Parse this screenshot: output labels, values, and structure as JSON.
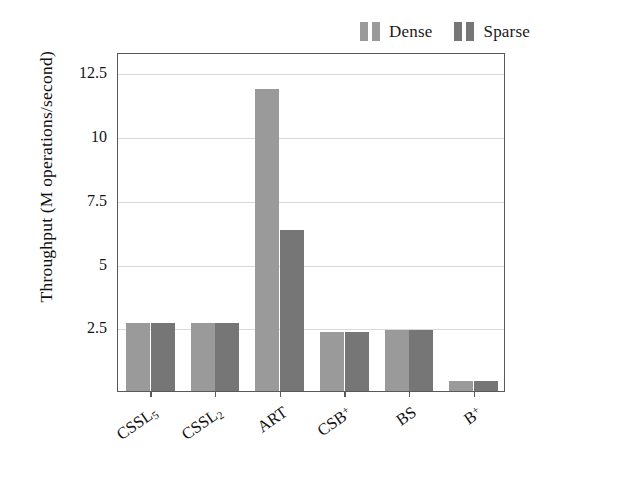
{
  "chart_data": {
    "type": "bar",
    "title": "",
    "subtitle": "",
    "xlabel": "",
    "ylabel": "Throughput (M operations/second)",
    "categories": [
      "CSSL5",
      "CSSL2",
      "ART",
      "CSB+",
      "BS",
      "B+"
    ],
    "category_labels_display": [
      {
        "base": "CSSL",
        "sub": "5",
        "sup": ""
      },
      {
        "base": "CSSL",
        "sub": "2",
        "sup": ""
      },
      {
        "base": "ART",
        "sub": "",
        "sup": ""
      },
      {
        "base": "CSB",
        "sub": "",
        "sup": "+"
      },
      {
        "base": "BS",
        "sub": "",
        "sup": ""
      },
      {
        "base": "B",
        "sub": "",
        "sup": "+"
      }
    ],
    "series": [
      {
        "name": "Dense",
        "color": "#9a9a9a",
        "values": [
          2.65,
          2.65,
          11.85,
          2.3,
          2.4,
          0.4
        ]
      },
      {
        "name": "Sparse",
        "color": "#767676",
        "values": [
          2.65,
          2.65,
          6.3,
          2.3,
          2.4,
          0.4
        ]
      }
    ],
    "ylim": [
      0,
      13.3
    ],
    "yticks": [
      2.5,
      5,
      7.5,
      10,
      12.5
    ],
    "ytick_labels": [
      "2.5",
      "5",
      "7.5",
      "10",
      "12.5"
    ],
    "grid": "horizontal",
    "legend_position": "top-right",
    "legend_entries": [
      "Dense",
      "Sparse"
    ],
    "axis_color": "#5a5a5a",
    "grid_color": "#d9d9d9",
    "background": "#ffffff"
  }
}
